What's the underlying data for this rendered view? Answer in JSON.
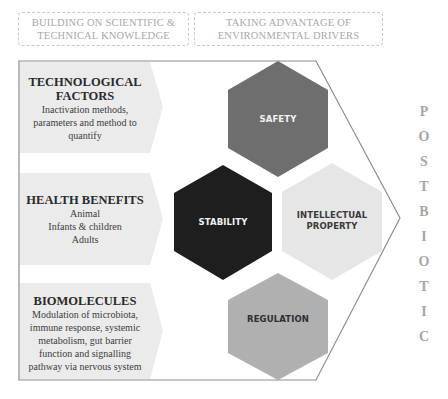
{
  "header": {
    "boxes": [
      {
        "lines": [
          "BUILDING ON SCIENTIFIC &",
          "TECHNICAL KNOWLEDGE"
        ]
      },
      {
        "lines": [
          "TAKING ADVANTAGE OF",
          "ENVIRONMENTAL DRIVERS"
        ]
      }
    ]
  },
  "panels": [
    {
      "title_lines": [
        "TECHNOLOGICAL",
        "FACTORS"
      ],
      "lines": [
        "Inactivation methods,",
        "parameters and method to",
        "quantify"
      ]
    },
    {
      "title_lines": [
        "HEALTH BENEFITS"
      ],
      "lines": [
        "Animal",
        "Infants & children",
        "Adults"
      ]
    },
    {
      "title_lines": [
        "BIOMOLECULES"
      ],
      "lines": [
        "Modulation of microbiota,",
        "immune response, systemic",
        "metabolism, gut barrier",
        "function and signalling",
        "pathway via nervous system"
      ]
    }
  ],
  "hexagons": [
    {
      "lines": [
        "SAFETY"
      ],
      "fill": "#6e6e6e",
      "text_color": "#f2f2f2"
    },
    {
      "lines": [
        "STABILITY"
      ],
      "fill": "#1e1e1e",
      "text_color": "#f2f2f2"
    },
    {
      "lines": [
        "INTELLECTUAL",
        "PROPERTY"
      ],
      "fill": "#e6e6e6",
      "text_color": "#3a3a3a"
    },
    {
      "lines": [
        "REGULATION"
      ],
      "fill": "#b0b0b0",
      "text_color": "#2e2e2e"
    }
  ],
  "vertical_word": {
    "letters": [
      "P",
      "O",
      "S",
      "T",
      "B",
      "I",
      "O",
      "T",
      "I",
      "C"
    ]
  },
  "colors": {
    "panel_fill": "#ebebeb",
    "frame_stroke": "#8c8c8c",
    "header_text": "#a8a8a8",
    "vertical_text": "#a6a6a6"
  }
}
